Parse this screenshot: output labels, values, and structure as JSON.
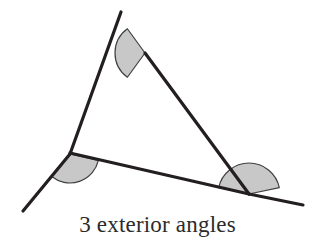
{
  "figure": {
    "caption": "3 exterior angles",
    "background_color": "#ffffff",
    "line_color": "#231f20",
    "line_width": 3.2,
    "arc_fill_color": "#c8c8c8",
    "arc_stroke_color": "#404040",
    "arc_stroke_width": 1.2,
    "caption_color": "#2b2b2b"
  },
  "geometry": {
    "type": "triangle-with-exterior-angles",
    "vertices": {
      "top": {
        "label": "top-vertex",
        "x": 145,
        "y": 53
      },
      "left": {
        "label": "left-vertex",
        "x": 70,
        "y": 154
      },
      "right": {
        "label": "right-vertex",
        "x": 249,
        "y": 194
      }
    },
    "sides": [
      {
        "name": "left-side",
        "from": "left",
        "to": "top"
      },
      {
        "name": "right-side",
        "from": "top",
        "to": "right"
      },
      {
        "name": "bottom-side",
        "from": "left",
        "to": "right"
      }
    ],
    "extended_rays": [
      {
        "name": "ray-top-extension",
        "from_vertex": "top",
        "x": 121,
        "y": 12
      },
      {
        "name": "ray-left-extension",
        "from_vertex": "left",
        "x": 23,
        "y": 211
      },
      {
        "name": "ray-right-extension",
        "from_vertex": "right",
        "x": 303,
        "y": 205
      }
    ],
    "segments": [
      {
        "name": "segment-upper-left-ray",
        "x1": 121,
        "y1": 12,
        "x2": 70,
        "y2": 154
      },
      {
        "name": "segment-lower-left-ray",
        "x1": 70,
        "y1": 154,
        "x2": 23,
        "y2": 211
      },
      {
        "name": "segment-right-side",
        "x1": 145,
        "y1": 53,
        "x2": 249,
        "y2": 194
      },
      {
        "name": "segment-bottom-side",
        "x1": 70,
        "y1": 153,
        "x2": 249,
        "y2": 194
      },
      {
        "name": "segment-bottom-ray",
        "x1": 249,
        "y1": 194,
        "x2": 303,
        "y2": 205
      }
    ],
    "exterior_angle_arcs": [
      {
        "name": "exterior-angle-top",
        "vertex": "top",
        "cx": 145,
        "cy": 53,
        "radius": 30,
        "start_angle_deg": 126,
        "end_angle_deg": 234,
        "sweep_deg": 108
      },
      {
        "name": "exterior-angle-left",
        "vertex": "left",
        "cx": 70,
        "cy": 154,
        "radius": 29,
        "start_angle_deg": 13,
        "end_angle_deg": 129,
        "sweep_deg": 116
      },
      {
        "name": "exterior-angle-right",
        "vertex": "right",
        "cx": 249,
        "cy": 194,
        "radius": 31,
        "start_angle_deg": 192,
        "end_angle_deg": 348,
        "sweep_deg": 156
      }
    ]
  }
}
